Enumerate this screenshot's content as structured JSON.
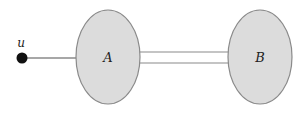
{
  "diagram": {
    "nodes": [
      {
        "id": "u",
        "label": "u",
        "type": "vertex",
        "color": "#111111"
      },
      {
        "id": "A",
        "label": "A",
        "type": "region",
        "fill": "#dcdcdc",
        "stroke": "#888888"
      },
      {
        "id": "B",
        "label": "B",
        "type": "region",
        "fill": "#dcdcdc",
        "stroke": "#888888"
      }
    ],
    "edges": [
      {
        "from": "u",
        "to": "A",
        "style": "single"
      },
      {
        "from": "A",
        "to": "B",
        "style": "double"
      }
    ]
  }
}
